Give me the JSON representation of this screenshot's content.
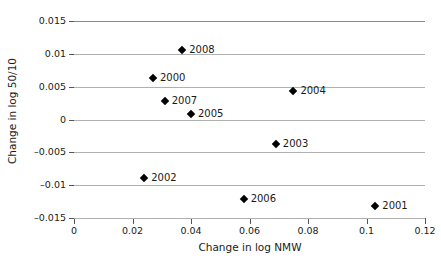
{
  "chart_data": {
    "type": "scatter",
    "title": "",
    "xlabel": "Change in log NMW",
    "ylabel": "Change in log 50/10",
    "xlim": [
      0,
      0.12
    ],
    "ylim": [
      -0.015,
      0.015
    ],
    "xticks": [
      "0",
      "0.02",
      "0.04",
      "0.06",
      "0.08",
      "0.1",
      "0.12"
    ],
    "xtick_values": [
      0,
      0.02,
      0.04,
      0.06,
      0.08,
      0.1,
      0.12
    ],
    "yticks": [
      "0.015",
      "0.01",
      "0.005",
      "0",
      "-0.005",
      "-0.01",
      "-0.015"
    ],
    "ytick_values": [
      0.015,
      0.01,
      0.005,
      0,
      -0.005,
      -0.01,
      -0.015
    ],
    "grid": "horizontal",
    "legend": "none",
    "marker": "black-diamond",
    "points": [
      {
        "label": "2008",
        "x": 0.037,
        "y": 0.0106
      },
      {
        "label": "2000",
        "x": 0.027,
        "y": 0.0063
      },
      {
        "label": "2004",
        "x": 0.075,
        "y": 0.0043
      },
      {
        "label": "2007",
        "x": 0.031,
        "y": 0.0028
      },
      {
        "label": "2005",
        "x": 0.04,
        "y": 0.0008
      },
      {
        "label": "2003",
        "x": 0.069,
        "y": -0.0037
      },
      {
        "label": "2002",
        "x": 0.024,
        "y": -0.0089
      },
      {
        "label": "2006",
        "x": 0.058,
        "y": -0.0121
      },
      {
        "label": "2001",
        "x": 0.103,
        "y": -0.0132
      }
    ]
  }
}
